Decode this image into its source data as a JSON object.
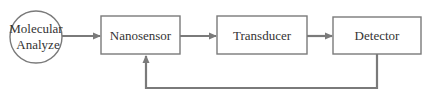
{
  "diagram": {
    "colors": {
      "stroke": "#7a7a7a",
      "arrow": "#7a7a7a",
      "text": "#333333",
      "background": "#ffffff"
    },
    "nodes": [
      {
        "id": "molecular-analyze",
        "shape": "circle",
        "label_line1": "Molecular",
        "label_line2": "Analyze"
      },
      {
        "id": "nanosensor",
        "shape": "rect",
        "label": "Nanosensor"
      },
      {
        "id": "transducer",
        "shape": "rect",
        "label": "Transducer"
      },
      {
        "id": "detector",
        "shape": "rect",
        "label": "Detector"
      }
    ],
    "edges": [
      {
        "from": "molecular-analyze",
        "to": "nanosensor",
        "type": "arrow"
      },
      {
        "from": "nanosensor",
        "to": "transducer",
        "type": "arrow"
      },
      {
        "from": "transducer",
        "to": "detector",
        "type": "arrow"
      },
      {
        "from": "detector",
        "to": "nanosensor",
        "type": "feedback-arrow"
      }
    ]
  }
}
